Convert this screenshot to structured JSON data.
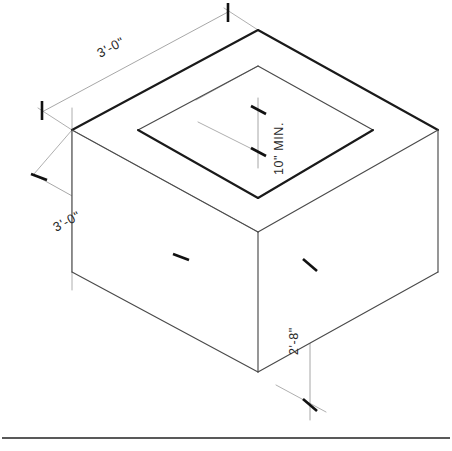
{
  "sheet": {
    "title": "Isometric Concrete Box / Vault Detail",
    "background_color": "#ffffff",
    "line_color": "#1a1a1a",
    "width": 452,
    "height": 451
  },
  "dimensions": {
    "top_left_width": {
      "label": "3'-0\"",
      "meaning": "overall plan width along upper-left edge",
      "orientation": "iso-aligned",
      "rotation_deg": -28
    },
    "lower_left_depth": {
      "label": "3'-0\"",
      "meaning": "overall plan depth along lower-left edge",
      "orientation": "iso-aligned",
      "rotation_deg": -28
    },
    "opening_wall": {
      "label": "10\" MIN.",
      "meaning": "minimum wall thickness at top opening",
      "orientation": "vertical-text",
      "rotation_deg": -90
    },
    "height": {
      "label": "2'-8\"",
      "meaning": "overall box height",
      "orientation": "vertical-text",
      "rotation_deg": -90
    }
  },
  "geometry": {
    "type": "isometric-box-with-opening",
    "top_face_outer": [
      [
        258,
        30
      ],
      [
        438,
        130
      ],
      [
        258,
        232
      ],
      [
        72,
        130
      ]
    ],
    "top_face_inner": [
      [
        258,
        66
      ],
      [
        373,
        130
      ],
      [
        258,
        198
      ],
      [
        138,
        130
      ]
    ],
    "left_vertical_edge": [
      [
        72,
        130
      ],
      [
        72,
        272
      ]
    ],
    "right_vertical_edge": [
      [
        438,
        130
      ],
      [
        438,
        272
      ]
    ],
    "front_vertical_edge": [
      [
        258,
        232
      ],
      [
        258,
        372
      ]
    ],
    "bottom_front_left": [
      [
        72,
        272
      ],
      [
        258,
        372
      ]
    ],
    "bottom_front_right": [
      [
        258,
        372
      ],
      [
        438,
        272
      ]
    ]
  },
  "annotations": {
    "tick_style": "architectural-slash",
    "border_rule_y": 438
  }
}
